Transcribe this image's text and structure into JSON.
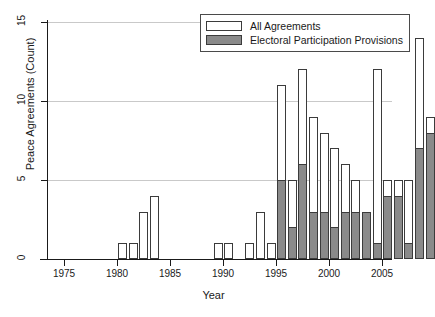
{
  "chart_data": {
    "type": "bar",
    "title": "",
    "xlabel": "Year",
    "ylabel": "Peace Agreements (Count)",
    "xlim": [
      1974,
      2006
    ],
    "ylim": [
      0,
      15
    ],
    "yticks": [
      0,
      5,
      10,
      15
    ],
    "xticks": [
      1975,
      1980,
      1985,
      1990,
      1995,
      2000,
      2005
    ],
    "grid": "horizontal",
    "legend_position": "top-right",
    "stacking": "overlaid",
    "categories": [
      1975,
      1976,
      1977,
      1978,
      1979,
      1980,
      1981,
      1982,
      1983,
      1984,
      1985,
      1986,
      1987,
      1988,
      1989,
      1990,
      1991,
      1992,
      1993,
      1994,
      1995,
      1996,
      1997,
      1998,
      1999,
      2000,
      2001,
      2002,
      2003,
      2004,
      2005
    ],
    "series": [
      {
        "name": "All Agreements",
        "color": "#ffffff",
        "values": [
          0,
          1,
          1,
          3,
          4,
          0,
          0,
          0,
          0,
          0,
          1,
          1,
          0,
          1,
          3,
          1,
          11,
          5,
          12,
          9,
          8,
          7,
          6,
          5,
          3,
          12,
          5,
          5,
          5,
          14,
          9
        ]
      },
      {
        "name": "Electoral Participation Provisions",
        "color": "#8a8a8a",
        "values": [
          0,
          0,
          0,
          0,
          0,
          0,
          0,
          0,
          0,
          0,
          0,
          0,
          0,
          0,
          0,
          0,
          5,
          2,
          6,
          3,
          3,
          2,
          3,
          3,
          3,
          1,
          4,
          4,
          1,
          7,
          8
        ]
      }
    ]
  },
  "legend": {
    "items": [
      {
        "label": "All Agreements",
        "swatch": "white"
      },
      {
        "label": "Electoral Participation Provisions",
        "swatch": "gray"
      }
    ]
  },
  "axes": {
    "y_label": "Peace Agreements (Count)",
    "x_label": "Year",
    "y_tick_labels": [
      "0",
      "5",
      "10",
      "15"
    ],
    "x_tick_labels": [
      "1975",
      "1980",
      "1985",
      "1990",
      "1995",
      "2000",
      "2005"
    ]
  },
  "colors": {
    "bar_total_fill": "#ffffff",
    "bar_sub_fill": "#8a8a8a",
    "bar_stroke": "#3b3b3b",
    "axis": "#1a1a1a",
    "grid": "#c9c9c9",
    "background": "#ffffff"
  }
}
